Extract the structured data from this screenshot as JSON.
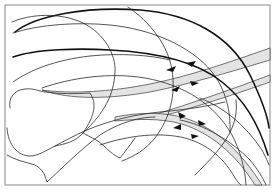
{
  "figure": {
    "title": "",
    "colors": {
      "background": "#ffffff",
      "frame": "#8a8a8a",
      "line": "#2a2a2a",
      "band_fill": "#e3e3e3",
      "arrowhead": "#111111"
    },
    "frame": {
      "x": 5,
      "y": 5,
      "width": 265,
      "height": 180
    },
    "contours": [
      {
        "id": "outer-thick-arc",
        "d": "M15,32 C35,16 85,6 140,10 C190,14 230,35 250,75 C262,100 268,118 269,128",
        "thick": true
      },
      {
        "id": "large-circle-outline",
        "d": "M12,22 C30,14 60,12 83,23 C105,34 116,55 115,72 C114,95 104,113 84,132",
        "thick": false
      },
      {
        "id": "arc-2",
        "d": "M13,33 C40,24 80,22 110,25 C150,29 190,45 212,72 C226,90 231,112 230,132",
        "thick": false
      },
      {
        "id": "vertical-arc",
        "d": "M128,7 C150,22 168,45 172,70 C176,95 170,118 155,138 C145,150 135,156 122,161",
        "thick": false
      },
      {
        "id": "arc-3",
        "d": "M13,57 C35,49 80,48 110,50 C150,52 195,60 222,82 C245,100 260,128 268,155",
        "thick": true
      },
      {
        "id": "arc-4",
        "d": "M13,82 C30,70 55,60 90,56 C120,53 150,55 170,60",
        "thick": false
      },
      {
        "id": "arc-5",
        "d": "M42,88 C70,78 110,72 145,78 C185,85 215,105 232,135 C240,150 245,168 246,185",
        "thick": false
      },
      {
        "id": "bone-outline",
        "d": "M10,108 C8,98 14,90 25,89 C33,88 38,91 45,92 C60,94 75,94 90,93 C97,104 95,115 83,133 C75,142 65,144 55,146 C45,151 38,156 30,156 C18,156 8,145 7,128",
        "thick": false
      },
      {
        "id": "shaft-lower",
        "d": "M7,155 C15,160 25,162 35,165 C44,170 45,176 47,182 C60,170 80,150 100,135 C120,122 140,117 155,117",
        "thick": false
      },
      {
        "id": "shaft-upper",
        "d": "M55,146 C70,138 85,130 100,125 C120,118 140,114 160,112 C180,110 200,108 225,102",
        "thick": false
      },
      {
        "id": "notch-line",
        "d": "M83,133 C90,137 98,140 104,146 C110,152 115,156 120,158 C125,152 130,145 135,138",
        "thick": false
      },
      {
        "id": "lower-arc-1",
        "d": "M100,145 C130,135 160,132 185,138 C210,145 225,160 235,178 C238,182 240,185 241,185",
        "thick": false
      },
      {
        "id": "lower-arc-2",
        "d": "M195,175 C210,160 225,145 232,128 C236,118 237,110 236,100",
        "thick": false
      },
      {
        "id": "right-arc-1",
        "d": "M180,120 C205,125 230,140 250,160 C258,170 263,178 266,185",
        "thick": false
      },
      {
        "id": "right-arc-2",
        "d": "M200,98 C225,108 245,125 262,150 C266,158 268,162 269,165",
        "thick": false
      }
    ],
    "bands": [
      {
        "id": "upper-band",
        "d": "M42,90 C70,94 110,92 150,84 C190,76 230,62 270,48 L270,60 C230,72 190,84 150,92 C110,99 70,100 42,90 Z"
      },
      {
        "id": "middle-band",
        "d": "M150,116 C190,104 230,90 270,75 L270,82 C230,96 190,109 152,119 Z"
      },
      {
        "id": "lower-band",
        "d": "M115,117 C140,112 165,112 185,118 C215,128 240,150 262,185 L255,185 C235,153 210,133 182,124 C160,118 138,119 115,121 Z"
      }
    ],
    "arrowheads": [
      {
        "id": "arrow-upper-1",
        "points": "166,70 176,66 173,72"
      },
      {
        "id": "arrow-upper-2",
        "points": "186,63 196,61 192,67"
      },
      {
        "id": "arrow-upper-3",
        "points": "171,90 180,86 177,92"
      },
      {
        "id": "arrow-upper-4",
        "points": "190,81 199,83 192,86"
      },
      {
        "id": "arrow-lower-1",
        "points": "178,112 186,116 180,119"
      },
      {
        "id": "arrow-lower-2",
        "points": "198,120 206,124 199,126"
      },
      {
        "id": "arrow-lower-3",
        "points": "173,128 181,124 181,130"
      },
      {
        "id": "arrow-lower-4",
        "points": "191,134 199,136 192,139"
      }
    ]
  }
}
